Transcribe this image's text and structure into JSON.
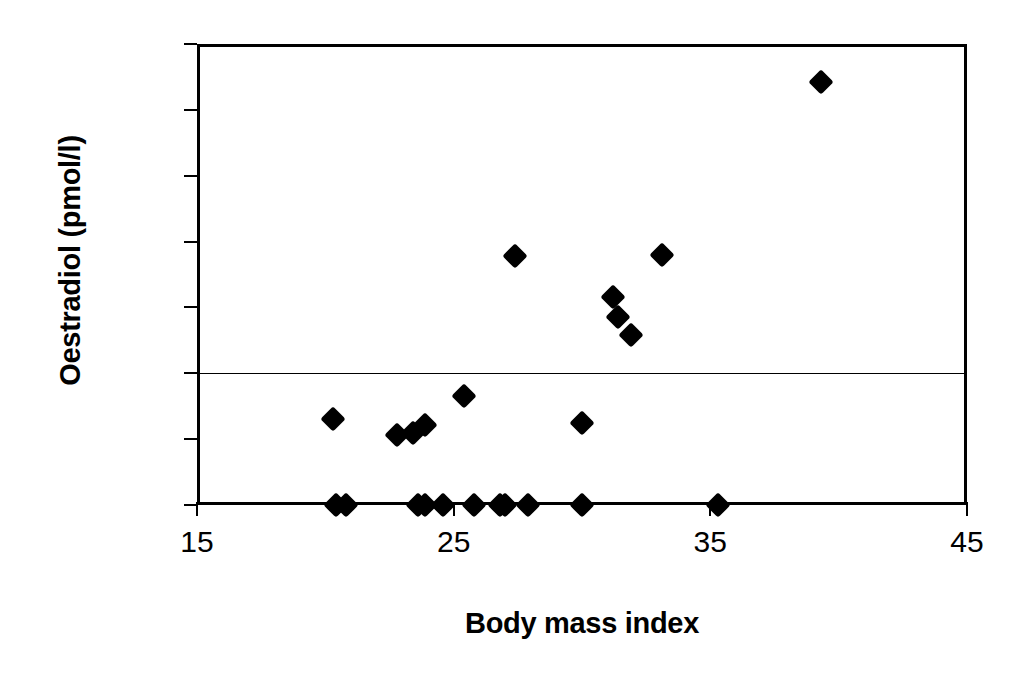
{
  "chart_data": {
    "type": "scatter",
    "title": "",
    "xlabel": "Body mass index",
    "ylabel": "Oestradiol (pmol/l)",
    "xlim": [
      15,
      45
    ],
    "ylim": [
      0,
      350
    ],
    "xticks": [
      15,
      25,
      35,
      45
    ],
    "xtick_labels": [
      "15",
      "25",
      "35",
      "45"
    ],
    "yticks": [
      0,
      50,
      100,
      150,
      200,
      250,
      300,
      350
    ],
    "ytick_labels": [
      "0",
      "50",
      "100",
      "150",
      "200",
      "250",
      "300",
      "350"
    ],
    "grid": "horizontal-line-at-100",
    "gridlines_y": [
      100
    ],
    "legend": "none",
    "marker_shape": "diamond",
    "marker_color": "#000000",
    "series": [
      {
        "name": "Subjects",
        "points": [
          {
            "x": 20.4,
            "y": 0
          },
          {
            "x": 20.8,
            "y": 0
          },
          {
            "x": 23.6,
            "y": 0
          },
          {
            "x": 23.9,
            "y": 0
          },
          {
            "x": 24.6,
            "y": 0
          },
          {
            "x": 25.8,
            "y": 0
          },
          {
            "x": 26.8,
            "y": 0
          },
          {
            "x": 27.0,
            "y": 0
          },
          {
            "x": 27.9,
            "y": 0
          },
          {
            "x": 30.0,
            "y": 0
          },
          {
            "x": 35.3,
            "y": 0
          },
          {
            "x": 20.3,
            "y": 65
          },
          {
            "x": 22.8,
            "y": 53
          },
          {
            "x": 23.4,
            "y": 55
          },
          {
            "x": 23.9,
            "y": 61
          },
          {
            "x": 25.4,
            "y": 83
          },
          {
            "x": 27.4,
            "y": 189
          },
          {
            "x": 30.0,
            "y": 62
          },
          {
            "x": 31.2,
            "y": 158
          },
          {
            "x": 31.4,
            "y": 143
          },
          {
            "x": 31.9,
            "y": 129
          },
          {
            "x": 33.1,
            "y": 190
          },
          {
            "x": 39.3,
            "y": 321
          }
        ]
      }
    ]
  }
}
